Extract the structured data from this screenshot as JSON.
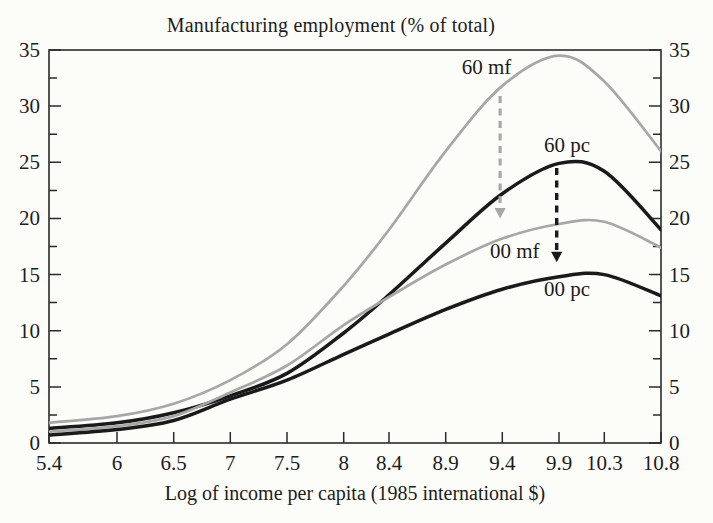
{
  "chart_data": {
    "type": "line",
    "title": "Manufacturing employment (% of total)",
    "xlabel": "Log of income per capita (1985 international $)",
    "ylabel": "",
    "xlim": [
      5.4,
      10.8
    ],
    "ylim": [
      0,
      35
    ],
    "x_tick_labels": [
      "5.4",
      "6",
      "6.5",
      "7",
      "7.5",
      "8",
      "8.4",
      "8.9",
      "9.4",
      "9.9",
      "10.3",
      "10.8"
    ],
    "x_tick_values": [
      5.4,
      6,
      6.5,
      7,
      7.5,
      8,
      8.4,
      8.9,
      9.4,
      9.9,
      10.3,
      10.8
    ],
    "y_tick_labels": [
      "0",
      "5",
      "10",
      "15",
      "20",
      "25",
      "30",
      "35"
    ],
    "y_tick_values": [
      0,
      5,
      10,
      15,
      20,
      25,
      30,
      35
    ],
    "y_minor_step": 2.5,
    "grid": false,
    "legend": "inline curve labels",
    "frame": "boxed plot, y tick marks and labels duplicated on left and right sides, ticks point inward",
    "x": [
      5.4,
      6,
      6.5,
      7,
      7.5,
      8,
      8.4,
      8.9,
      9.4,
      9.9,
      10.3,
      10.8
    ],
    "series": [
      {
        "name": "60 mf",
        "color_key": "gray",
        "stroke_width": 2.7,
        "values": [
          1.8,
          2.4,
          3.5,
          5.6,
          8.8,
          14.0,
          19.0,
          26.0,
          31.8,
          34.5,
          32.2,
          26.0
        ],
        "label": {
          "text": "60 mf",
          "x": 9.26,
          "y": 33.5
        }
      },
      {
        "name": "60 pc",
        "color_key": "black",
        "stroke_width": 3.5,
        "values": [
          1.3,
          1.8,
          2.7,
          4.2,
          6.2,
          9.8,
          13.2,
          17.8,
          22.2,
          24.9,
          24.2,
          19.0
        ],
        "label": {
          "text": "60 pc",
          "x": 9.97,
          "y": 26.5
        }
      },
      {
        "name": "00 mf",
        "color_key": "gray",
        "stroke_width": 2.7,
        "values": [
          1.0,
          1.5,
          2.4,
          4.5,
          6.9,
          10.5,
          13.0,
          15.9,
          18.2,
          19.5,
          19.7,
          17.4
        ],
        "label": {
          "text": "00 mf",
          "x": 9.51,
          "y": 17.1
        }
      },
      {
        "name": "00 pc",
        "color_key": "black",
        "stroke_width": 3.5,
        "values": [
          0.7,
          1.2,
          2.0,
          3.9,
          5.6,
          7.9,
          9.7,
          11.9,
          13.7,
          14.8,
          15.0,
          13.1
        ],
        "label": {
          "text": "00 pc",
          "x": 9.97,
          "y": 13.7
        }
      }
    ],
    "arrows": [
      {
        "name": "drop-60mf-to-00mf",
        "color_key": "gray",
        "x": 9.38,
        "y_from": 30.9,
        "y_to": 20.0
      },
      {
        "name": "drop-60pc-to-00pc",
        "color_key": "black",
        "x": 9.88,
        "y_from": 24.5,
        "y_to": 16.1
      }
    ],
    "colors": {
      "black": "#1a1a1a",
      "gray": "#a7a7a7",
      "axis": "#2b2b2b",
      "text": "#1c1c1c",
      "background": "#fcfcf9"
    }
  }
}
